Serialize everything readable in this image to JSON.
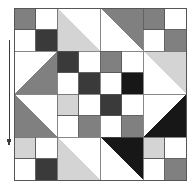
{
  "figure": {
    "background_color": "#ffffff",
    "canvas": {
      "width": 190,
      "height": 191
    }
  },
  "palette": {
    "white": "#ffffff",
    "light_gray": "#d4d4d4",
    "medium_gray": "#808080",
    "dark_gray": "#3a3a3a",
    "black": "#171717",
    "outline": "#555555",
    "annotation": "#3b3b3b"
  },
  "quilt": {
    "label": "Quilt pattern grid",
    "origin_x": 14,
    "origin_y": 8,
    "block_size": 43,
    "rows": 4,
    "cols": 4,
    "outline_color": "#555555",
    "blocks": [
      {
        "row": 0,
        "col": 0,
        "type": "four-patch",
        "name": "block-r0c0",
        "patches": [
          "medium_gray",
          "white",
          "white",
          "dark_gray"
        ]
      },
      {
        "row": 0,
        "col": 1,
        "type": "hst",
        "name": "block-r0c1",
        "orientation": "lower-left",
        "patches": [
          "light_gray",
          "white"
        ]
      },
      {
        "row": 0,
        "col": 2,
        "type": "hst",
        "name": "block-r0c2",
        "orientation": "upper-right",
        "patches": [
          "medium_gray",
          "white"
        ]
      },
      {
        "row": 0,
        "col": 3,
        "type": "four-patch",
        "name": "block-r0c3",
        "patches": [
          "medium_gray",
          "white",
          "white",
          "medium_gray"
        ]
      },
      {
        "row": 1,
        "col": 0,
        "type": "hst",
        "name": "block-r1c0",
        "orientation": "lower-right",
        "patches": [
          "medium_gray",
          "white"
        ]
      },
      {
        "row": 1,
        "col": 1,
        "type": "four-patch",
        "name": "block-r1c1",
        "patches": [
          "dark_gray",
          "white",
          "white",
          "dark_gray"
        ]
      },
      {
        "row": 1,
        "col": 2,
        "type": "four-patch",
        "name": "block-r1c2",
        "patches": [
          "medium_gray",
          "white",
          "white",
          "black"
        ]
      },
      {
        "row": 1,
        "col": 3,
        "type": "hst",
        "name": "block-r1c3",
        "orientation": "upper-right",
        "patches": [
          "light_gray",
          "white"
        ]
      },
      {
        "row": 2,
        "col": 0,
        "type": "hst",
        "name": "block-r2c0",
        "orientation": "lower-left",
        "patches": [
          "medium_gray",
          "white"
        ]
      },
      {
        "row": 2,
        "col": 1,
        "type": "four-patch",
        "name": "block-r2c1",
        "patches": [
          "light_gray",
          "white",
          "white",
          "medium_gray"
        ]
      },
      {
        "row": 2,
        "col": 2,
        "type": "four-patch",
        "name": "block-r2c2",
        "patches": [
          "dark_gray",
          "white",
          "white",
          "medium_gray"
        ]
      },
      {
        "row": 2,
        "col": 3,
        "type": "hst",
        "name": "block-r2c3",
        "orientation": "lower-right",
        "patches": [
          "black",
          "white"
        ]
      },
      {
        "row": 3,
        "col": 0,
        "type": "four-patch",
        "name": "block-r3c0",
        "patches": [
          "light_gray",
          "white",
          "white",
          "dark_gray"
        ]
      },
      {
        "row": 3,
        "col": 1,
        "type": "hst",
        "name": "block-r3c1",
        "orientation": "lower-left",
        "patches": [
          "light_gray",
          "white"
        ]
      },
      {
        "row": 3,
        "col": 2,
        "type": "hst",
        "name": "block-r3c2",
        "orientation": "upper-right",
        "patches": [
          "black",
          "white"
        ]
      },
      {
        "row": 3,
        "col": 3,
        "type": "four-patch",
        "name": "block-r3c3",
        "patches": [
          "light_gray",
          "white",
          "white",
          "medium_gray"
        ]
      }
    ]
  },
  "annotation": {
    "name": "vertical-measure-arrow",
    "description": "vertical line with downward arrowhead along left margin",
    "x": 9,
    "y_top": 40,
    "y_bottom": 140,
    "color": "#3b3b3b",
    "stroke_width": 1,
    "arrow_head": "down",
    "label": ""
  }
}
